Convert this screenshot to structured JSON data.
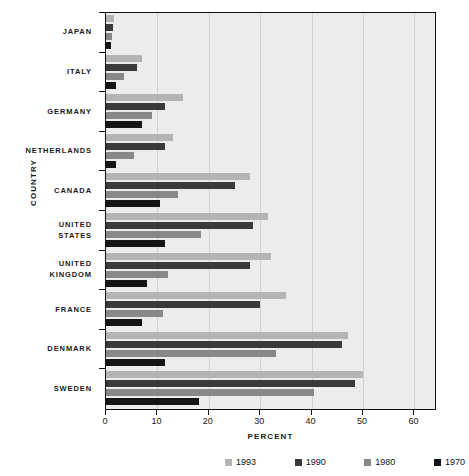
{
  "chart_data": {
    "type": "bar",
    "orientation": "horizontal",
    "title": "",
    "xlabel": "PERCENT",
    "ylabel": "COUNTRY",
    "xlim": [
      0,
      64
    ],
    "xticks": [
      0,
      10,
      20,
      30,
      40,
      50,
      60
    ],
    "xtick_labels": [
      "0",
      "10",
      "20",
      "30",
      "40",
      "50",
      "60"
    ],
    "grid": "vertical",
    "legend_position": "bottom",
    "categories": [
      "JAPAN",
      "ITALY",
      "GERMANY",
      "NETHERLANDS",
      "CANADA",
      "UNITED STATES",
      "UNITED KINGDOM",
      "FRANCE",
      "DENMARK",
      "SWEDEN"
    ],
    "category_lines": [
      [
        "JAPAN"
      ],
      [
        "ITALY"
      ],
      [
        "GERMANY"
      ],
      [
        "NETHERLANDS"
      ],
      [
        "CANADA"
      ],
      [
        "UNITED",
        "STATES"
      ],
      [
        "UNITED",
        "KINGDOM"
      ],
      [
        "FRANCE"
      ],
      [
        "DENMARK"
      ],
      [
        "SWEDEN"
      ]
    ],
    "series": [
      {
        "name": "1993",
        "color": "#b4b4b4",
        "values": [
          1.5,
          7.0,
          15.0,
          13.0,
          28.0,
          31.5,
          32.0,
          35.0,
          47.0,
          50.0
        ]
      },
      {
        "name": "1990",
        "color": "#3a3a3a",
        "values": [
          1.3,
          6.0,
          11.5,
          11.5,
          25.0,
          28.5,
          28.0,
          30.0,
          46.0,
          48.5
        ]
      },
      {
        "name": "1980",
        "color": "#888888",
        "values": [
          1.2,
          3.5,
          9.0,
          5.5,
          14.0,
          18.5,
          12.0,
          11.0,
          33.0,
          40.5
        ]
      },
      {
        "name": "1970",
        "color": "#151515",
        "values": [
          1.0,
          2.0,
          7.0,
          2.0,
          10.5,
          11.5,
          8.0,
          7.0,
          11.5,
          18.0
        ]
      }
    ]
  },
  "legend": {
    "items": [
      {
        "label": "1993",
        "color": "#b4b4b4"
      },
      {
        "label": "1990",
        "color": "#3a3a3a"
      },
      {
        "label": "1980",
        "color": "#888888"
      },
      {
        "label": "1970",
        "color": "#151515"
      }
    ]
  },
  "axes": {
    "x_title": "PERCENT",
    "y_title": "COUNTRY"
  },
  "colors": {
    "plot_background": "#ececec",
    "frame": "#111111",
    "gridline": "#d2d2d2",
    "page_background": "#ffffff"
  }
}
